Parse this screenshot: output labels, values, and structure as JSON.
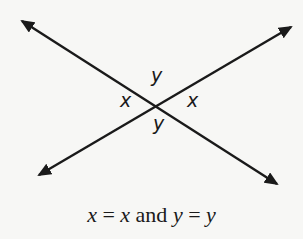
{
  "diagram": {
    "colors": {
      "background": "#f7f7f5",
      "line": "#1a1a1a"
    },
    "lines": [
      {
        "name": "line-1",
        "from": [
          22,
          21
        ],
        "to": [
          277,
          184
        ],
        "arrowheads": "both"
      },
      {
        "name": "line-2",
        "from": [
          291,
          27
        ],
        "to": [
          39,
          175
        ],
        "arrowheads": "both"
      }
    ],
    "intersection": [
      161,
      102
    ],
    "labels": {
      "top": "y",
      "left": "x",
      "right": "x",
      "bottom": "y"
    },
    "caption": {
      "var1": "x",
      "eq1": " = ",
      "var2": "x",
      "conj": " and ",
      "var3": "y",
      "eq2": " = ",
      "var4": "y"
    }
  }
}
